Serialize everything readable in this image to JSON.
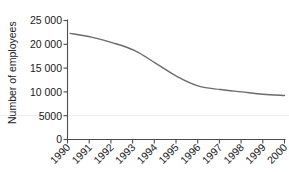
{
  "chart_data": {
    "type": "line",
    "title": "",
    "xlabel": "",
    "ylabel": "Number of employees",
    "x": [
      1990,
      1991,
      1992,
      1993,
      1994,
      1995,
      1996,
      1997,
      1998,
      1999,
      2000
    ],
    "categories": [
      "1990",
      "1991",
      "1992",
      "1993",
      "1994",
      "1995",
      "1996",
      "1997",
      "1998",
      "1999",
      "2000"
    ],
    "values": [
      22300,
      21500,
      20300,
      18700,
      16000,
      13200,
      11200,
      10500,
      10000,
      9500,
      9250
    ],
    "series": [
      {
        "name": "Number of employees",
        "values": [
          22300,
          21500,
          20300,
          18700,
          16000,
          13200,
          11200,
          10500,
          10000,
          9500,
          9250
        ]
      }
    ],
    "ylim": [
      0,
      25000
    ],
    "xlim": [
      1990,
      2000
    ],
    "yticks": [
      0,
      5000,
      10000,
      15000,
      20000,
      25000
    ],
    "ytick_labels": [
      "0",
      "5000",
      "10 000",
      "15 000",
      "20 000",
      "25 000"
    ],
    "xtick_labels": [
      "1990",
      "1991",
      "1992",
      "1993",
      "1994",
      "1995",
      "1996",
      "1997",
      "1998",
      "1999",
      "2000"
    ],
    "grid": false,
    "legend": false,
    "legend_position": "none",
    "line_color": "#6b6b6b",
    "axis_color": "#4d4d4d",
    "text_color": "#1a1a1a",
    "background_color": "#ffffff",
    "xtick_label_rotation": 45
  },
  "axis": {
    "y_title": "Number of employees"
  }
}
